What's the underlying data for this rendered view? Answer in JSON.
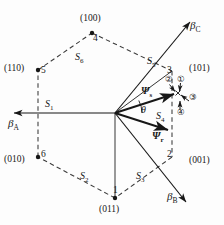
{
  "figure": {
    "background_color": "#fdfdfd",
    "line_color": "#171717"
  },
  "axes": [
    {
      "name": "beta-a",
      "label": "β",
      "subscript": "A",
      "direction": "left"
    },
    {
      "name": "beta-b",
      "label": "β",
      "subscript": "B",
      "direction": "lower-right"
    },
    {
      "name": "beta-c",
      "label": "β",
      "subscript": "C",
      "direction": "upper-right"
    }
  ],
  "vertices": [
    {
      "number": "1",
      "state": "(011)",
      "position": "bottom"
    },
    {
      "number": "2",
      "state": "(001)",
      "position": "lower-right"
    },
    {
      "number": "3",
      "state": "(101)",
      "position": "upper-right"
    },
    {
      "number": "4",
      "state": "(100)",
      "position": "top"
    },
    {
      "number": "5",
      "state": "(110)",
      "position": "upper-left"
    },
    {
      "number": "6",
      "state": "(010)",
      "position": "lower-left"
    }
  ],
  "sectors": [
    {
      "label": "S",
      "subscript": "1"
    },
    {
      "label": "S",
      "subscript": "2"
    },
    {
      "label": "S",
      "subscript": "3"
    },
    {
      "label": "S",
      "subscript": "4"
    },
    {
      "label": "S",
      "subscript": "5"
    },
    {
      "label": "S",
      "subscript": "6"
    }
  ],
  "vectors": [
    {
      "name": "stator-flux",
      "label": "Ψ",
      "subscript": "s"
    },
    {
      "name": "rotor-flux",
      "label": "Ψ",
      "subscript": "r"
    }
  ],
  "angle": {
    "label": "θ"
  },
  "increments": [
    {
      "id": "1",
      "glyph": "①"
    },
    {
      "id": "2",
      "glyph": "②"
    },
    {
      "id": "3",
      "glyph": "③"
    },
    {
      "id": "4",
      "glyph": "④"
    }
  ]
}
